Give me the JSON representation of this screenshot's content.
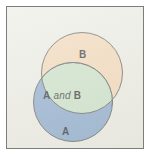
{
  "figure": {
    "type": "venn-diagram",
    "sets": [
      {
        "id": "B",
        "label": "B",
        "fill": "#f2d1ad",
        "stroke": "#4e4f4c",
        "position": "upper-right"
      },
      {
        "id": "A",
        "label": "A",
        "fill": "#7d9fc8",
        "stroke": "#4e4f4c",
        "position": "lower-left"
      }
    ],
    "intersection": {
      "label_a": "A",
      "label_conjunction": "and",
      "label_b": "B",
      "fill": "#c4ddc1",
      "stroke": "#4e4f4c"
    },
    "frame": {
      "background": "#e9e9e1",
      "border_color": "#7b7e7b"
    }
  }
}
